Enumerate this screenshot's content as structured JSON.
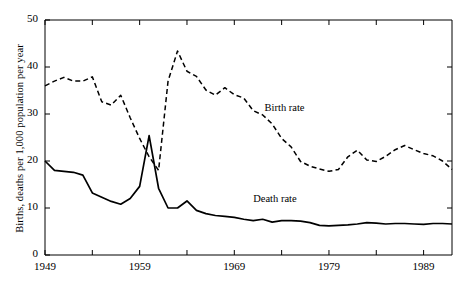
{
  "chart_data": {
    "type": "line",
    "title": "",
    "xlabel": "",
    "ylabel": "Births, deaths per 1,000 population per year",
    "xlim": [
      1949,
      1992
    ],
    "ylim": [
      0,
      50
    ],
    "yticks": [
      0,
      10,
      20,
      30,
      40,
      50
    ],
    "ytick_labels": [
      "0",
      "10",
      "20",
      "30",
      "40",
      "50"
    ],
    "xticks": [
      1949,
      1954,
      1959,
      1964,
      1969,
      1974,
      1979,
      1984,
      1989
    ],
    "xtick_labels": [
      "1949",
      "",
      "1959",
      "",
      "1969",
      "",
      "1979",
      "",
      "1989"
    ],
    "grid": false,
    "legend_position": "inline-annotation",
    "annotations": [
      {
        "text": "Birth rate",
        "x": 1972.2,
        "y": 31.0
      },
      {
        "text": "Death rate",
        "x": 1971.0,
        "y": 11.6
      }
    ],
    "series": [
      {
        "name": "Birth rate",
        "style": "dashed",
        "color": "#000000",
        "x": [
          1949,
          1950,
          1951,
          1952,
          1953,
          1954,
          1955,
          1956,
          1957,
          1958,
          1959,
          1960,
          1961,
          1962,
          1963,
          1964,
          1965,
          1966,
          1967,
          1968,
          1969,
          1970,
          1971,
          1972,
          1973,
          1974,
          1975,
          1976,
          1977,
          1978,
          1979,
          1980,
          1981,
          1982,
          1983,
          1984,
          1985,
          1986,
          1987,
          1988,
          1989,
          1990,
          1991,
          1992
        ],
        "values": [
          36.0,
          37.0,
          37.8,
          37.0,
          37.0,
          37.9,
          32.6,
          31.9,
          34.0,
          29.2,
          24.8,
          20.9,
          18.0,
          37.0,
          43.4,
          39.1,
          38.0,
          35.1,
          34.0,
          35.6,
          34.1,
          33.4,
          30.7,
          29.8,
          27.9,
          24.8,
          23.0,
          19.9,
          18.9,
          18.3,
          17.8,
          18.2,
          20.9,
          22.3,
          20.2,
          19.9,
          21.0,
          22.4,
          23.3,
          22.4,
          21.6,
          21.1,
          20.0,
          18.2
        ]
      },
      {
        "name": "Death rate",
        "style": "solid",
        "color": "#000000",
        "x": [
          1949,
          1950,
          1951,
          1952,
          1953,
          1954,
          1955,
          1956,
          1957,
          1958,
          1959,
          1960,
          1961,
          1962,
          1963,
          1964,
          1965,
          1966,
          1967,
          1968,
          1969,
          1970,
          1971,
          1972,
          1973,
          1974,
          1975,
          1976,
          1977,
          1978,
          1979,
          1980,
          1981,
          1982,
          1983,
          1984,
          1985,
          1986,
          1987,
          1988,
          1989,
          1990,
          1991,
          1992
        ],
        "values": [
          20.0,
          18.0,
          17.8,
          17.6,
          17.0,
          13.2,
          12.3,
          11.4,
          10.8,
          12.0,
          14.6,
          25.4,
          14.2,
          10.0,
          10.0,
          11.5,
          9.5,
          8.8,
          8.4,
          8.2,
          8.0,
          7.6,
          7.3,
          7.6,
          7.0,
          7.3,
          7.3,
          7.2,
          6.9,
          6.3,
          6.2,
          6.3,
          6.4,
          6.6,
          6.9,
          6.8,
          6.6,
          6.7,
          6.7,
          6.6,
          6.5,
          6.7,
          6.7,
          6.6
        ]
      }
    ]
  },
  "axes": {
    "y_title": "Births, deaths per 1,000 population per year"
  }
}
